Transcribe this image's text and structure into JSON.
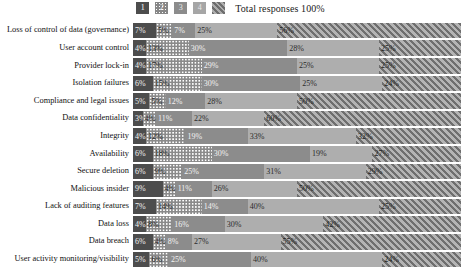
{
  "legend": {
    "items": [
      {
        "key": "1",
        "label": "1",
        "swatch": "solid-dark-swatch"
      },
      {
        "key": "2",
        "label": "2",
        "swatch": "dotted-swatch"
      },
      {
        "key": "3",
        "label": "3",
        "swatch": "solid-medium-swatch"
      },
      {
        "key": "4",
        "label": "4",
        "swatch": "solid-light-swatch"
      },
      {
        "key": "5",
        "label": "",
        "swatch": "diagonal-hatch-swatch"
      }
    ],
    "total_label": "Total responses 100%"
  },
  "colors": {
    "series1": "#4d4d4d",
    "series2": "#8a8a8a",
    "series3": "#8c8c8c",
    "series4": "#aeaeae",
    "series5": "#9a9a9a",
    "background": "#ffffff",
    "text": "#111111"
  },
  "chart_data": {
    "type": "bar",
    "orientation": "horizontal",
    "stacked": true,
    "normalized_percent": true,
    "title": "",
    "subtitle": "",
    "xlabel": "",
    "ylabel": "",
    "xlim": [
      0,
      100
    ],
    "grid": false,
    "legend_position": "top-center",
    "annotation": "Total responses 100%",
    "categories": [
      "Loss of control of data (governance)",
      "User account control",
      "Provider lock-in",
      "Isolation failures",
      "Compliance and legal issues",
      "Data confidentiality",
      "Integrity",
      "Availability",
      "Secure deletion",
      "Malicious insider",
      "Lack of auditing features",
      "Data loss",
      "Data breach",
      "User activity monitoring/visibility"
    ],
    "series": [
      {
        "name": "1",
        "values": [
          7,
          4,
          4,
          6,
          5,
          3,
          4,
          6,
          6,
          9,
          7,
          4,
          6,
          5
        ]
      },
      {
        "name": "2",
        "values": [
          5,
          13,
          17,
          15,
          5,
          4,
          12,
          18,
          9,
          4,
          14,
          8,
          4,
          6
        ]
      },
      {
        "name": "3",
        "values": [
          7,
          30,
          29,
          30,
          12,
          11,
          19,
          30,
          25,
          11,
          14,
          16,
          8,
          25
        ]
      },
      {
        "name": "4",
        "values": [
          25,
          28,
          25,
          25,
          28,
          22,
          33,
          19,
          31,
          26,
          40,
          30,
          27,
          40
        ]
      },
      {
        "name": "5",
        "values": [
          56,
          25,
          25,
          24,
          50,
          60,
          32,
          27,
          29,
          50,
          25,
          42,
          55,
          24
        ]
      }
    ],
    "labels": [
      [
        "7%",
        "5%",
        "7%",
        "25%",
        "56%"
      ],
      [
        "4%",
        "13%",
        "30%",
        "28%",
        "25%"
      ],
      [
        "4%",
        "17%",
        "29%",
        "25%",
        "25%"
      ],
      [
        "6%",
        "15%",
        "30%",
        "25%",
        "24%"
      ],
      [
        "5%",
        "5%",
        "12%",
        "28%",
        "50%"
      ],
      [
        "3%",
        "4%",
        "11%",
        "22%",
        "60%"
      ],
      [
        "4%",
        "12%",
        "19%",
        "33%",
        "32%"
      ],
      [
        "6%",
        "18%",
        "30%",
        "19%",
        "27%"
      ],
      [
        "6%",
        "9%",
        "25%",
        "31%",
        "29%"
      ],
      [
        "9%",
        "4%",
        "11%",
        "26%",
        "50%"
      ],
      [
        "7%",
        "14%",
        "14%",
        "40%",
        "25%"
      ],
      [
        "4%",
        "8%",
        "16%",
        "30%",
        "42%"
      ],
      [
        "6%",
        "4%",
        "8%",
        "27%",
        "55%"
      ],
      [
        "5%",
        "6%",
        "25%",
        "40%",
        "24%"
      ]
    ]
  }
}
